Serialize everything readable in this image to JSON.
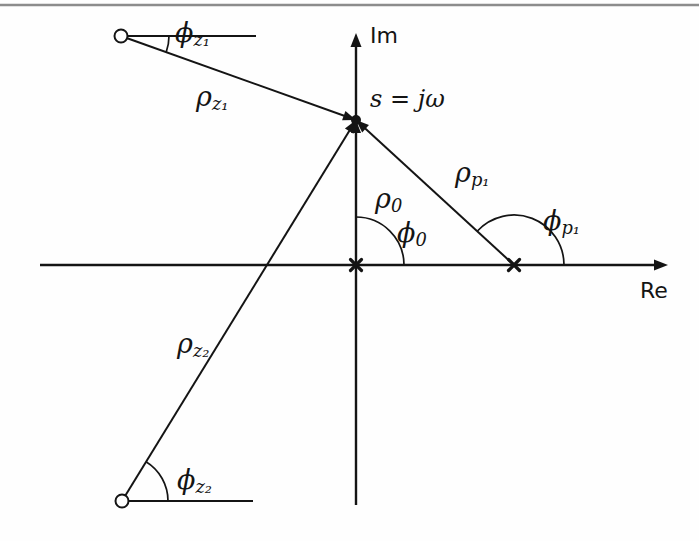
{
  "figure": {
    "background_color": "#fefefe",
    "ink_color": "#141414",
    "top_rule_color": "#8c8c8c",
    "width": 699,
    "height": 541
  },
  "axes": {
    "real": {
      "label": "Re",
      "label_x": 640,
      "label_y": 292,
      "x1": 40,
      "y1": 265,
      "x2": 668,
      "y2": 265,
      "arrow": "right"
    },
    "imag": {
      "label": "Im",
      "label_x": 370,
      "label_y": 37,
      "x1": 356,
      "y1": 505,
      "x2": 356,
      "y2": 33,
      "arrow": "up"
    }
  },
  "markers": [
    {
      "name": "zero-upper",
      "glyph": "o",
      "x": 121,
      "y": 36,
      "radius": 6.5
    },
    {
      "name": "zero-lower",
      "glyph": "o",
      "x": 122,
      "y": 501,
      "radius": 6.5
    },
    {
      "name": "pole-origin",
      "glyph": "x",
      "x": 356,
      "y": 265,
      "size": 11
    },
    {
      "name": "pole-real",
      "glyph": "x",
      "x": 514,
      "y": 265,
      "size": 11
    },
    {
      "name": "test-point",
      "glyph": "dot",
      "x": 356,
      "y": 120,
      "radius": 5
    }
  ],
  "vectors": [
    {
      "name": "rho-z1",
      "label": "ρ",
      "subscript": "z₁",
      "from_x": 121,
      "from_y": 36,
      "to_x": 356,
      "to_y": 120,
      "label_x": 196,
      "label_y": 98
    },
    {
      "name": "rho-z2",
      "label": "ρ",
      "subscript": "z₂",
      "from_x": 122,
      "from_y": 501,
      "to_x": 356,
      "to_y": 120,
      "label_x": 177,
      "label_y": 345
    },
    {
      "name": "rho-p1",
      "label": "ρ",
      "subscript": "p₁",
      "from_x": 514,
      "from_y": 265,
      "to_x": 356,
      "to_y": 120,
      "label_x": 455,
      "label_y": 174
    },
    {
      "name": "rho-0",
      "label": "ρ",
      "subscript": "0",
      "from_x": 356,
      "from_y": 265,
      "to_x": 356,
      "to_y": 120,
      "label_x": 375,
      "label_y": 200
    }
  ],
  "reference_lines": [
    {
      "name": "ref-line-upper-zero",
      "x1": 121,
      "y1": 36,
      "x2": 256,
      "y2": 36
    },
    {
      "name": "ref-line-lower-zero",
      "x1": 122,
      "y1": 501,
      "x2": 253,
      "y2": 501
    }
  ],
  "angles": [
    {
      "name": "phi-z1",
      "label": "ϕ",
      "subscript": "z₁",
      "vertex_x": 121,
      "vertex_y": 36,
      "radius": 48,
      "start_deg": 0,
      "end_deg": -19.7,
      "label_x": 175,
      "label_y": 34
    },
    {
      "name": "phi-z2",
      "label": "ϕ",
      "subscript": "z₂",
      "vertex_x": 122,
      "vertex_y": 501,
      "radius": 46,
      "start_deg": 0,
      "end_deg": 58.5,
      "label_x": 177,
      "label_y": 481
    },
    {
      "name": "phi-0",
      "label": "ϕ",
      "subscript": "0",
      "vertex_x": 356,
      "vertex_y": 265,
      "radius": 48,
      "start_deg": 0,
      "end_deg": 90,
      "label_x": 397,
      "label_y": 234
    },
    {
      "name": "phi-p1",
      "label": "ϕ",
      "subscript": "p₁",
      "vertex_x": 514,
      "vertex_y": 265,
      "radius": 50,
      "start_deg": 0,
      "end_deg": 137.5,
      "label_x": 543,
      "label_y": 222
    }
  ],
  "annotations": [
    {
      "name": "test-point-label",
      "text": "s = jω",
      "x": 370,
      "y": 100
    }
  ]
}
